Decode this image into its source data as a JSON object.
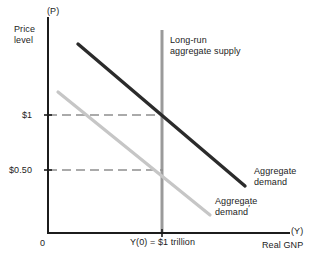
{
  "figure": {
    "background": "#ffffff",
    "axis_color": "#1c1c1c",
    "text_color": "#1c1c1c"
  },
  "axes": {
    "y_axis_symbol": "(P)",
    "y_axis_label": "Price\nlevel",
    "x_axis_symbol": "(Y)",
    "x_axis_label": "Real GNP",
    "origin_label": "0"
  },
  "y_ticks": [
    {
      "label": "$1",
      "value": 1.0
    },
    {
      "label": "$0.50",
      "value": 0.5
    }
  ],
  "x_ticks": [
    {
      "label": "Y(0) = $1 trillion",
      "value": 1.0
    }
  ],
  "series_labels": {
    "lras": "Long-run\naggregate supply",
    "aggregate_demand": "Aggregate\ndemand",
    "aggregate_demand_prime_line1": "Aggregate",
    "aggregate_demand_prime_line2": "demand",
    "prime_mark": "′"
  },
  "colors": {
    "aggregate_demand": "#2b2b2b",
    "aggregate_demand_prime": "#c6c6c6",
    "lras": "#9a9a9a",
    "dashed_guide": "#8f8f8f"
  },
  "chart_data": {
    "type": "line",
    "title": "",
    "xlabel": "Real GNP",
    "ylabel": "Price level",
    "xlim": [
      0,
      1.55
    ],
    "ylim": [
      0,
      1.75
    ],
    "grid": false,
    "legend_position": "inline-annotations",
    "series": [
      {
        "name": "Aggregate demand",
        "color": "#2b2b2b",
        "style": "solid",
        "points": [
          {
            "x": 0.26,
            "y": 1.52
          },
          {
            "x": 1.06,
            "y": 0.76
          }
        ],
        "annotation": "Aggregate demand"
      },
      {
        "name": "Aggregate demand'",
        "color": "#c6c6c6",
        "style": "solid",
        "points": [
          {
            "x": 0.05,
            "y": 1.22
          },
          {
            "x": 0.87,
            "y": 0.38
          }
        ],
        "annotation": "Aggregate demand'"
      },
      {
        "name": "Long-run aggregate supply",
        "color": "#9a9a9a",
        "style": "vertical",
        "points": [
          {
            "x": 1.0,
            "y": 1.75
          },
          {
            "x": 1.0,
            "y": 0.0
          }
        ],
        "annotation": "Long-run aggregate supply"
      }
    ],
    "equilibria": [
      {
        "name": "initial",
        "x": 1.0,
        "y": 1.0,
        "price_label": "$1",
        "output_label": "Y(0) = $1 trillion"
      },
      {
        "name": "after shift",
        "x": 1.0,
        "y": 0.5,
        "price_label": "$0.50",
        "output_label": "Y(0) = $1 trillion"
      }
    ],
    "guides": [
      {
        "type": "horizontal-dashed",
        "y": 1.0,
        "from_x": 0.0,
        "to_x": 1.0
      },
      {
        "type": "horizontal-dashed",
        "y": 0.5,
        "from_x": 0.0,
        "to_x": 1.0
      }
    ]
  }
}
